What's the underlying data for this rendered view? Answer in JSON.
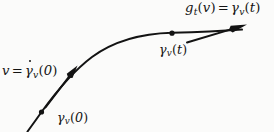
{
  "figure": {
    "kind": "geodesic-flow-diagram",
    "background_color": "#fbfbfa",
    "ink_color": "#131313",
    "labels": {
      "tangent_at_t": {
        "name": "g_t(v) = gamma-dot_v(t)",
        "head": "g",
        "head_sub": "t",
        "head_arg_open": "(",
        "head_arg": "v",
        "head_arg_close": ")",
        "equals": "=",
        "tail_gamma": "γ",
        "tail_sub": "v",
        "tail_arg_open": "(",
        "tail_arg": "t",
        "tail_arg_close": ")"
      },
      "tangent_at_zero": {
        "name": "v = gamma-dot_v(0)",
        "head": "v",
        "equals": "=",
        "tail_gamma": "γ",
        "tail_sub": "v",
        "tail_arg_open": "(",
        "tail_arg": "0",
        "tail_arg_close": ")"
      },
      "point_at_t": {
        "name": "gamma_v(t)",
        "gamma": "γ",
        "sub": "v",
        "arg_open": "(",
        "arg": "t",
        "arg_close": ")"
      },
      "point_at_zero": {
        "name": "gamma_v(0)",
        "gamma": "γ",
        "sub": "v",
        "arg_open": "(",
        "arg": "0",
        "arg_close": ")"
      }
    },
    "geometry": {
      "curve_path": "M 27.5 131.5 C 33 124 37 118.5 41.5 112 C 56 92 72 72 92 57 C 114 41 142 33.5 172 32.8 C 198 32.3 222 31.2 242 29.6",
      "arrow_at_zero": {
        "from_x": 45.5,
        "from_y": 107.5,
        "to_x": 77.5,
        "to_y": 65.5
      },
      "arrow_at_t": {
        "from_x": 187.0,
        "from_y": 42.5,
        "to_x": 247.0,
        "to_y": 24.5
      },
      "point_marker_zero": {
        "cx": 41.5,
        "cy": 112.0,
        "r": 2.6
      },
      "point_marker_t": {
        "cx": 172.0,
        "cy": 33.2,
        "r": 2.6
      }
    }
  }
}
